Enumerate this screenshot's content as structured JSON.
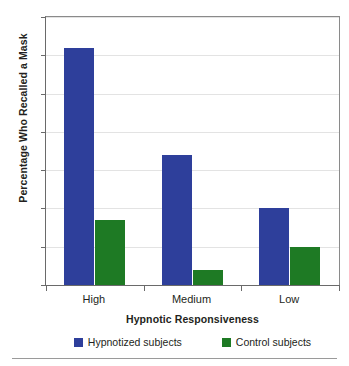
{
  "chart_data": {
    "type": "bar",
    "title": "",
    "xlabel": "Hypnotic Responsiveness",
    "ylabel": "Percentage Who Recalled a Mask",
    "categories": [
      "High",
      "Medium",
      "Low"
    ],
    "series": [
      {
        "name": "Hypnotized subjects",
        "color": "#2e3f9b",
        "values": [
          62,
          34,
          20
        ]
      },
      {
        "name": "Control subjects",
        "color": "#1e7a24",
        "values": [
          17,
          4,
          10
        ]
      }
    ],
    "ylim": [
      0,
      70
    ],
    "ytick_labels": [
      "0",
      "10",
      "20",
      "30",
      "40",
      "50",
      "60",
      "70"
    ],
    "ytick_values": [
      0,
      10,
      20,
      30,
      40,
      50,
      60,
      70
    ],
    "grid": true,
    "legend_position": "bottom"
  },
  "colors": {
    "series_blue": "#2e3f9b",
    "series_green": "#1e7a24",
    "gridline": "#e3e3e3",
    "axis": "#6a6a6a",
    "text": "#231f20"
  }
}
